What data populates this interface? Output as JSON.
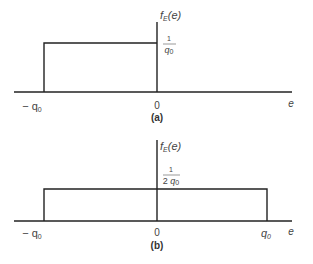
{
  "figure": {
    "panels": [
      {
        "id": "a",
        "caption": "(a)",
        "y_axis_label": {
          "func": "f",
          "sub": "E",
          "arg": "(e)"
        },
        "x_axis_label": "e",
        "height_label": {
          "num": "1",
          "den_main": "q",
          "den_sub": "0",
          "den_prefix": ""
        },
        "ticks": [
          {
            "label_main": "− q",
            "label_sub": "0",
            "value": "-q0"
          },
          {
            "label_main": "0",
            "label_sub": "",
            "value": "0"
          }
        ],
        "interval": [
          "-q0",
          "0"
        ],
        "density": "1/q0"
      },
      {
        "id": "b",
        "caption": "(b)",
        "y_axis_label": {
          "func": "f",
          "sub": "E",
          "arg": "(e)"
        },
        "x_axis_label": "e",
        "height_label": {
          "num": "1",
          "den_main": "q",
          "den_sub": "0",
          "den_prefix": "2 "
        },
        "ticks": [
          {
            "label_main": "− q",
            "label_sub": "0",
            "value": "-q0"
          },
          {
            "label_main": "0",
            "label_sub": "",
            "value": "0"
          },
          {
            "label_main": "q",
            "label_sub": "0",
            "value": "q0"
          }
        ],
        "interval": [
          "-q0",
          "q0"
        ],
        "density": "1/(2q0)"
      }
    ],
    "colors": {
      "line": "#222222",
      "text": "#444444"
    }
  }
}
